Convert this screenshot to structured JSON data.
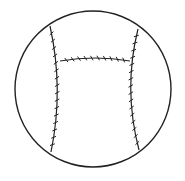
{
  "figure": {
    "description": "Line drawing of a ball with stitched seams forming an H shape",
    "background_color": "#ffffff",
    "stroke_color": "#222222",
    "ball": {
      "center": [
        93,
        89
      ],
      "radius": 78,
      "stroke_width": 1.4
    },
    "seams": {
      "left": {
        "path": "M50,26 Q64,89 51,152",
        "stitch_count": 16
      },
      "right": {
        "path": "M138,29 Q123,89 139,150",
        "stitch_count": 16
      },
      "crossbar": {
        "path": "M60,61 Q95,55 130,61",
        "stitch_count": 10
      }
    }
  }
}
